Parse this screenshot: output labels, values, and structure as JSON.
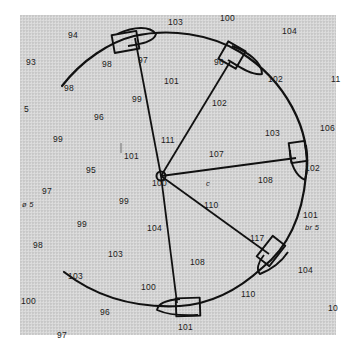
{
  "diagram": {
    "type": "swing-circle sounding chart",
    "center_label": "100",
    "center_note": "c",
    "radial_labels": [
      "97",
      "96",
      "102",
      "17",
      "101"
    ],
    "soundings": [
      {
        "text": "103",
        "x": 168,
        "y": 18
      },
      {
        "text": "100",
        "x": 220,
        "y": 14
      },
      {
        "text": "104",
        "x": 282,
        "y": 27
      },
      {
        "text": "94",
        "x": 68,
        "y": 31
      },
      {
        "text": "93",
        "x": 26,
        "y": 58
      },
      {
        "text": "98",
        "x": 102,
        "y": 60
      },
      {
        "text": "97",
        "x": 138,
        "y": 56
      },
      {
        "text": "98",
        "x": 64,
        "y": 84
      },
      {
        "text": "101",
        "x": 164,
        "y": 77
      },
      {
        "text": "99",
        "x": 132,
        "y": 95
      },
      {
        "text": "96",
        "x": 214,
        "y": 58
      },
      {
        "text": "102",
        "x": 268,
        "y": 75
      },
      {
        "text": "11",
        "x": 331,
        "y": 75
      },
      {
        "text": "102",
        "x": 212,
        "y": 99
      },
      {
        "text": "5",
        "x": 24,
        "y": 105
      },
      {
        "text": "96",
        "x": 94,
        "y": 113
      },
      {
        "text": "99",
        "x": 53,
        "y": 135
      },
      {
        "text": "103",
        "x": 265,
        "y": 129
      },
      {
        "text": "106",
        "x": 320,
        "y": 124
      },
      {
        "text": "111",
        "x": 161,
        "y": 136
      },
      {
        "text": "101",
        "x": 124,
        "y": 152
      },
      {
        "text": "107",
        "x": 209,
        "y": 150
      },
      {
        "text": "95",
        "x": 86,
        "y": 166
      },
      {
        "text": "108",
        "x": 258,
        "y": 176
      },
      {
        "text": "102",
        "x": 305,
        "y": 164
      },
      {
        "text": "110",
        "x": 204,
        "y": 201
      },
      {
        "text": "97",
        "x": 42,
        "y": 187
      },
      {
        "text": "99",
        "x": 119,
        "y": 197
      },
      {
        "text": "101",
        "x": 303,
        "y": 211
      },
      {
        "text": "99",
        "x": 77,
        "y": 220
      },
      {
        "text": "104",
        "x": 147,
        "y": 224
      },
      {
        "text": "117",
        "x": 250,
        "y": 234
      },
      {
        "text": "98",
        "x": 33,
        "y": 241
      },
      {
        "text": "103",
        "x": 108,
        "y": 250
      },
      {
        "text": "108",
        "x": 190,
        "y": 258
      },
      {
        "text": "104",
        "x": 298,
        "y": 266
      },
      {
        "text": "103",
        "x": 68,
        "y": 272
      },
      {
        "text": "100",
        "x": 141,
        "y": 283
      },
      {
        "text": "110",
        "x": 241,
        "y": 290
      },
      {
        "text": "100",
        "x": 21,
        "y": 297
      },
      {
        "text": "96",
        "x": 100,
        "y": 308
      },
      {
        "text": "101",
        "x": 178,
        "y": 323
      },
      {
        "text": "10",
        "x": 328,
        "y": 304
      },
      {
        "text": "97",
        "x": 57,
        "y": 331
      }
    ],
    "notes": [
      {
        "text": "ø 5",
        "x": 22,
        "y": 201
      },
      {
        "text": "br 5",
        "x": 305,
        "y": 224
      }
    ],
    "colors": {
      "ink": "#111111",
      "paper": "#d4d4d4",
      "background": "#ffffff"
    }
  }
}
